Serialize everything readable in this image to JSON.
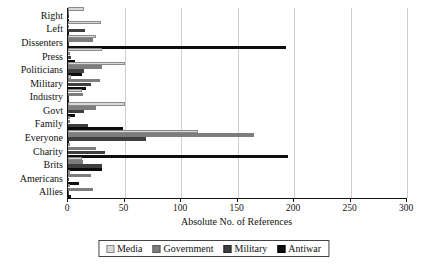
{
  "chart_data": {
    "type": "bar",
    "orientation": "horizontal",
    "title": "",
    "xlabel": "Absolute No. of References",
    "ylabel": "",
    "xlim": [
      0,
      300
    ],
    "xticks": [
      0,
      50,
      100,
      150,
      200,
      250,
      300
    ],
    "grid": true,
    "legend_position": "bottom",
    "categories": [
      "Right",
      "Left",
      "Dissenters",
      "Press",
      "Politicians",
      "Military",
      "Industry",
      "Govt",
      "Family",
      "Everyone",
      "Charity",
      "Brits",
      "Americans",
      "Allies"
    ],
    "series": [
      {
        "name": "Media",
        "color": "#d9d9d9",
        "values": [
          14,
          29,
          25,
          30,
          50,
          3,
          12,
          50,
          2,
          115,
          2,
          12,
          2,
          2
        ]
      },
      {
        "name": "Government",
        "color": "#7d7d7d",
        "values": [
          1,
          1,
          22,
          2,
          30,
          28,
          13,
          25,
          2,
          165,
          25,
          13,
          20,
          22
        ]
      },
      {
        "name": "Military",
        "color": "#3f3f3f",
        "values": [
          1,
          15,
          1,
          3,
          14,
          20,
          1,
          14,
          18,
          69,
          33,
          30,
          1,
          1
        ]
      },
      {
        "name": "Antiwar",
        "color": "#0d0d0d",
        "values": [
          1,
          1,
          193,
          6,
          12,
          16,
          1,
          6,
          49,
          1,
          195,
          30,
          10,
          3
        ]
      }
    ]
  },
  "axis": {
    "xlabel": "Absolute No. of References",
    "tick_labels": [
      "0",
      "50",
      "100",
      "150",
      "200",
      "250",
      "300"
    ]
  },
  "legend": {
    "items": [
      {
        "label": "Media"
      },
      {
        "label": "Government"
      },
      {
        "label": "Military"
      },
      {
        "label": "Antiwar"
      }
    ]
  }
}
